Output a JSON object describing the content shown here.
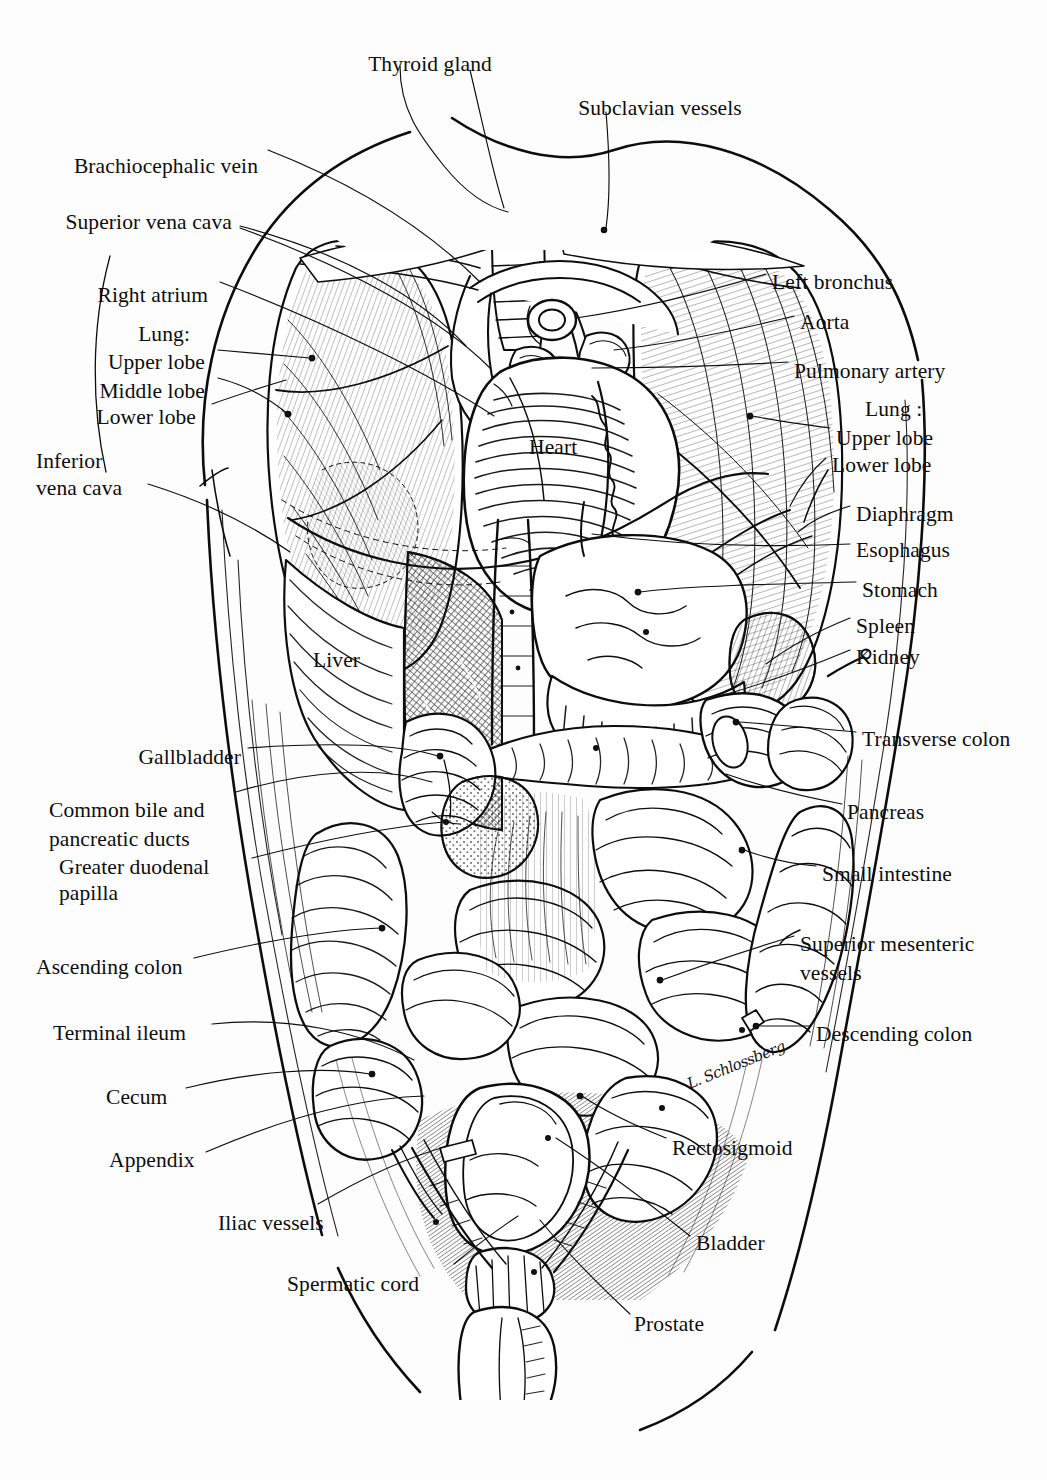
{
  "figure": {
    "background_color": "#fdfdfd",
    "ink_color": "#0d0d0d",
    "signature": "L. Schlossberg"
  },
  "labels": {
    "thyroid_gland": "Thyroid gland",
    "subclavian_vessels": "Subclavian vessels",
    "brachiocephalic_vein": "Brachiocephalic vein",
    "superior_vena_cava": "Superior vena cava",
    "right_atrium": "Right atrium",
    "lung_right_heading": "Lung:",
    "upper_lobe_right": "Upper lobe",
    "middle_lobe_right": "Middle lobe",
    "lower_lobe_right": "Lower lobe",
    "inferior_vena_cava_l1": "Inferior",
    "inferior_vena_cava_l2": "vena cava",
    "left_bronchus": "Left bronchus",
    "aorta": "Aorta",
    "pulmonary_artery": "Pulmonary artery",
    "lung_left_heading": "Lung :",
    "upper_lobe_left": "Upper lobe",
    "lower_lobe_left": "Lower lobe",
    "diaphragm": "Diaphragm",
    "esophagus": "Esophagus",
    "stomach": "Stomach",
    "spleen": "Spleen",
    "kidney": "Kidney",
    "heart": "Heart",
    "liver": "Liver",
    "gallbladder": "Gallbladder",
    "common_bile_l1": "Common bile and",
    "common_bile_l2": "pancreatic ducts",
    "greater_duodenal_l1": "Greater duodenal",
    "greater_duodenal_l2": "papilla",
    "ascending_colon": "Ascending colon",
    "terminal_ileum": "Terminal ileum",
    "cecum": "Cecum",
    "appendix": "Appendix",
    "iliac_vessels": "Iliac vessels",
    "spermatic_cord": "Spermatic cord",
    "transverse_colon": "Transverse colon",
    "pancreas": "Pancreas",
    "small_intestine": "Small intestine",
    "superior_mesenteric_l1": "Superior mesenteric",
    "superior_mesenteric_l2": "vessels",
    "descending_colon": "Descending colon",
    "rectosigmoid": "Rectosigmoid",
    "bladder": "Bladder",
    "prostate": "Prostate"
  },
  "label_positions": [
    {
      "key": "thyroid_gland",
      "x": 430,
      "y": 52,
      "align": "c"
    },
    {
      "key": "subclavian_vessels",
      "x": 660,
      "y": 96,
      "align": "c"
    },
    {
      "key": "brachiocephalic_vein",
      "x": 258,
      "y": 154,
      "align": "r"
    },
    {
      "key": "superior_vena_cava",
      "x": 232,
      "y": 210,
      "align": "r"
    },
    {
      "key": "right_atrium",
      "x": 208,
      "y": 283,
      "align": "r"
    },
    {
      "key": "lung_right_heading",
      "x": 190,
      "y": 322,
      "align": "r"
    },
    {
      "key": "upper_lobe_right",
      "x": 205,
      "y": 350,
      "align": "r"
    },
    {
      "key": "middle_lobe_right",
      "x": 205,
      "y": 379,
      "align": "r"
    },
    {
      "key": "lower_lobe_right",
      "x": 196,
      "y": 405,
      "align": "r"
    },
    {
      "key": "inferior_vena_cava_l1",
      "x": 36,
      "y": 449,
      "align": "l"
    },
    {
      "key": "inferior_vena_cava_l2",
      "x": 36,
      "y": 476,
      "align": "l"
    },
    {
      "key": "left_bronchus",
      "x": 772,
      "y": 270,
      "align": "l"
    },
    {
      "key": "aorta",
      "x": 800,
      "y": 310,
      "align": "l"
    },
    {
      "key": "pulmonary_artery",
      "x": 794,
      "y": 359,
      "align": "l"
    },
    {
      "key": "lung_left_heading",
      "x": 865,
      "y": 397,
      "align": "l"
    },
    {
      "key": "upper_lobe_left",
      "x": 836,
      "y": 426,
      "align": "l"
    },
    {
      "key": "lower_lobe_left",
      "x": 832,
      "y": 453,
      "align": "l"
    },
    {
      "key": "diaphragm",
      "x": 856,
      "y": 502,
      "align": "l"
    },
    {
      "key": "esophagus",
      "x": 856,
      "y": 538,
      "align": "l"
    },
    {
      "key": "stomach",
      "x": 862,
      "y": 578,
      "align": "l"
    },
    {
      "key": "spleen",
      "x": 856,
      "y": 614,
      "align": "l"
    },
    {
      "key": "kidney",
      "x": 856,
      "y": 645,
      "align": "l"
    },
    {
      "key": "heart",
      "x": 529,
      "y": 435,
      "align": "l"
    },
    {
      "key": "liver",
      "x": 313,
      "y": 648,
      "align": "l"
    },
    {
      "key": "gallbladder",
      "x": 241,
      "y": 745,
      "align": "r"
    },
    {
      "key": "common_bile_l1",
      "x": 49,
      "y": 798,
      "align": "l"
    },
    {
      "key": "common_bile_l2",
      "x": 49,
      "y": 827,
      "align": "l"
    },
    {
      "key": "greater_duodenal_l1",
      "x": 59,
      "y": 855,
      "align": "l"
    },
    {
      "key": "greater_duodenal_l2",
      "x": 59,
      "y": 881,
      "align": "l"
    },
    {
      "key": "ascending_colon",
      "x": 36,
      "y": 955,
      "align": "l"
    },
    {
      "key": "terminal_ileum",
      "x": 53,
      "y": 1021,
      "align": "l"
    },
    {
      "key": "cecum",
      "x": 106,
      "y": 1085,
      "align": "l"
    },
    {
      "key": "appendix",
      "x": 109,
      "y": 1148,
      "align": "l"
    },
    {
      "key": "iliac_vessels",
      "x": 218,
      "y": 1211,
      "align": "l"
    },
    {
      "key": "spermatic_cord",
      "x": 287,
      "y": 1272,
      "align": "l"
    },
    {
      "key": "transverse_colon",
      "x": 862,
      "y": 727,
      "align": "l"
    },
    {
      "key": "pancreas",
      "x": 847,
      "y": 800,
      "align": "l"
    },
    {
      "key": "small_intestine",
      "x": 822,
      "y": 862,
      "align": "l"
    },
    {
      "key": "superior_mesenteric_l1",
      "x": 800,
      "y": 932,
      "align": "l"
    },
    {
      "key": "superior_mesenteric_l2",
      "x": 800,
      "y": 961,
      "align": "l"
    },
    {
      "key": "descending_colon",
      "x": 816,
      "y": 1022,
      "align": "l"
    },
    {
      "key": "rectosigmoid",
      "x": 672,
      "y": 1136,
      "align": "l"
    },
    {
      "key": "bladder",
      "x": 696,
      "y": 1231,
      "align": "l"
    },
    {
      "key": "prostate",
      "x": 634,
      "y": 1312,
      "align": "l"
    }
  ]
}
